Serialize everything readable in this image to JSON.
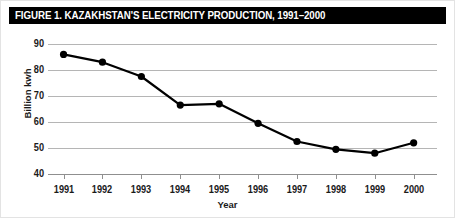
{
  "figure": {
    "title": "FIGURE 1. KAZAKHSTAN'S ELECTRICITY PRODUCTION, 1991–2000",
    "title_bar_color": "#000000",
    "title_text_color": "#ffffff",
    "background_color": "#ffffff",
    "gridline_color": "#b5b5b5",
    "series_color": "#000000"
  },
  "chart_data": {
    "type": "line",
    "title": "FIGURE 1. KAZAKHSTAN'S ELECTRICITY PRODUCTION, 1991–2000",
    "xlabel": "Year",
    "ylabel": "Billion kwh",
    "categories": [
      "1991",
      "1992",
      "1993",
      "1994",
      "1995",
      "1996",
      "1997",
      "1998",
      "1999",
      "2000"
    ],
    "x": [
      1991,
      1992,
      1993,
      1994,
      1995,
      1996,
      1997,
      1998,
      1999,
      2000
    ],
    "values": [
      86,
      83,
      77.5,
      66.5,
      67,
      59.5,
      52.5,
      49.5,
      48,
      52
    ],
    "series": [
      {
        "name": "Electricity production",
        "values": [
          86,
          83,
          77.5,
          66.5,
          67,
          59.5,
          52.5,
          49.5,
          48,
          52
        ]
      }
    ],
    "ylim": [
      40,
      90
    ],
    "yticks": [
      40,
      50,
      60,
      70,
      80,
      90
    ],
    "ytick_labels": [
      "40",
      "50",
      "60",
      "70",
      "80",
      "90"
    ],
    "xlim": [
      1990.6,
      2000.6
    ],
    "grid": "horizontal",
    "legend": "none",
    "marker": "filled-circle"
  }
}
